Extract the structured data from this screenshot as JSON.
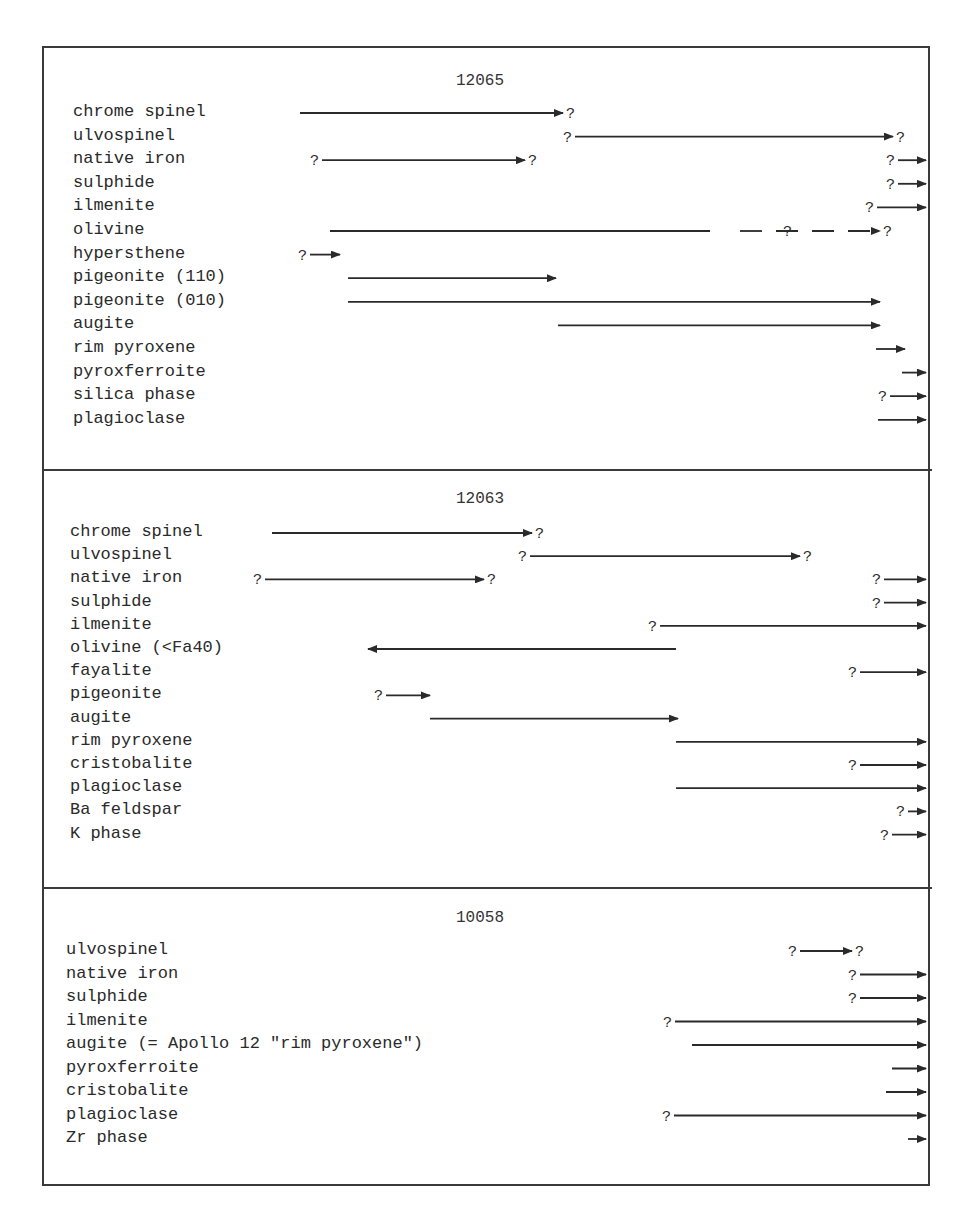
{
  "sections": [
    {
      "title": "12065",
      "title_x": 480,
      "title_y": 72,
      "label_x": 73,
      "row_start_y": 112,
      "row_step": 23.6,
      "rows": [
        {
          "label": "chrome spinel",
          "x1": 300,
          "x2": 563,
          "q_start": false,
          "q_end": true,
          "arrow": true
        },
        {
          "label": "ulvospinel",
          "x1": 575,
          "x2": 893,
          "q_start": true,
          "q_end": true,
          "arrow": true
        },
        {
          "label": "native iron",
          "x1": 322,
          "x2": 525,
          "q_start": true,
          "q_end": true,
          "arrow": true,
          "extra": {
            "x1": 898,
            "x2": 926,
            "q_start": true
          }
        },
        {
          "label": "sulphide",
          "x1": 898,
          "x2": 926,
          "q_start": true,
          "q_end": false,
          "arrow": true
        },
        {
          "label": "ilmenite",
          "x1": 877,
          "x2": 926,
          "q_start": true,
          "q_end": false,
          "arrow": true
        },
        {
          "label": "olivine",
          "x1": 330,
          "x2": 710,
          "q_start": false,
          "q_end": false,
          "arrow": false,
          "dashed_tail": {
            "x1": 740,
            "x2": 880,
            "q_mid_x": 783,
            "q_end": true
          }
        },
        {
          "label": "hypersthene",
          "x1": 310,
          "x2": 340,
          "q_start": true,
          "q_end": false,
          "arrow": true
        },
        {
          "label": "pigeonite (110)",
          "x1": 348,
          "x2": 556,
          "q_start": false,
          "q_end": false,
          "arrow": true
        },
        {
          "label": "pigeonite (010)",
          "x1": 348,
          "x2": 880,
          "q_start": false,
          "q_end": false,
          "arrow": true
        },
        {
          "label": "augite",
          "x1": 558,
          "x2": 880,
          "q_start": false,
          "q_end": false,
          "arrow": true
        },
        {
          "label": "rim pyroxene",
          "x1": 876,
          "x2": 905,
          "q_start": false,
          "q_end": false,
          "arrow": true
        },
        {
          "label": "pyroxferroite",
          "x1": 902,
          "x2": 926,
          "q_start": false,
          "q_end": false,
          "arrow": true
        },
        {
          "label": "silica phase",
          "x1": 890,
          "x2": 926,
          "q_start": true,
          "q_end": false,
          "arrow": true
        },
        {
          "label": "plagioclase",
          "x1": 878,
          "x2": 926,
          "q_start": false,
          "q_end": false,
          "arrow": true
        }
      ]
    },
    {
      "title": "12063",
      "title_x": 480,
      "title_y": 490,
      "label_x": 70,
      "row_start_y": 532,
      "row_step": 23.2,
      "rows": [
        {
          "label": "chrome spinel",
          "x1": 272,
          "x2": 532,
          "q_start": false,
          "q_end": true,
          "arrow": true
        },
        {
          "label": "ulvospinel",
          "x1": 530,
          "x2": 800,
          "q_start": true,
          "q_end": true,
          "arrow": true
        },
        {
          "label": "native iron",
          "x1": 265,
          "x2": 484,
          "q_start": true,
          "q_end": true,
          "arrow": true,
          "extra": {
            "x1": 884,
            "x2": 926,
            "q_start": true
          }
        },
        {
          "label": "sulphide",
          "x1": 884,
          "x2": 926,
          "q_start": true,
          "q_end": false,
          "arrow": true
        },
        {
          "label": "ilmenite",
          "x1": 660,
          "x2": 926,
          "q_start": true,
          "q_end": false,
          "arrow": true
        },
        {
          "label": "olivine (<Fa40)",
          "x1": 368,
          "x2": 676,
          "q_start": false,
          "q_end": false,
          "arrow": false,
          "arrow_left": true
        },
        {
          "label": "fayalite",
          "x1": 860,
          "x2": 926,
          "q_start": true,
          "q_end": false,
          "arrow": true
        },
        {
          "label": "pigeonite",
          "x1": 386,
          "x2": 430,
          "q_start": true,
          "q_end": false,
          "arrow": true
        },
        {
          "label": "augite",
          "x1": 430,
          "x2": 678,
          "q_start": false,
          "q_end": false,
          "arrow": true
        },
        {
          "label": "rim pyroxene",
          "x1": 676,
          "x2": 926,
          "q_start": false,
          "q_end": false,
          "arrow": true
        },
        {
          "label": "cristobalite",
          "x1": 860,
          "x2": 926,
          "q_start": true,
          "q_end": false,
          "arrow": true
        },
        {
          "label": "plagioclase",
          "x1": 676,
          "x2": 926,
          "q_start": false,
          "q_end": false,
          "arrow": true
        },
        {
          "label": "Ba feldspar",
          "x1": 908,
          "x2": 926,
          "q_start": true,
          "q_end": false,
          "arrow": true
        },
        {
          "label": "K phase",
          "x1": 892,
          "x2": 926,
          "q_start": true,
          "q_end": false,
          "arrow": true
        }
      ]
    },
    {
      "title": "10058",
      "title_x": 480,
      "title_y": 909,
      "label_x": 66,
      "row_start_y": 950,
      "row_step": 23.5,
      "rows": [
        {
          "label": "ulvospinel",
          "x1": 800,
          "x2": 852,
          "q_start": true,
          "q_end": true,
          "arrow": true
        },
        {
          "label": "native iron",
          "x1": 860,
          "x2": 926,
          "q_start": true,
          "q_end": false,
          "arrow": true
        },
        {
          "label": "sulphide",
          "x1": 860,
          "x2": 926,
          "q_start": true,
          "q_end": false,
          "arrow": true
        },
        {
          "label": "ilmenite",
          "x1": 675,
          "x2": 926,
          "q_start": true,
          "q_end": false,
          "arrow": true
        },
        {
          "label": "augite (= Apollo 12 \"rim pyroxene\")",
          "x1": 692,
          "x2": 926,
          "q_start": false,
          "q_end": false,
          "arrow": true
        },
        {
          "label": "pyroxferroite",
          "x1": 892,
          "x2": 926,
          "q_start": false,
          "q_end": false,
          "arrow": true
        },
        {
          "label": "cristobalite",
          "x1": 886,
          "x2": 926,
          "q_start": false,
          "q_end": false,
          "arrow": true
        },
        {
          "label": "plagioclase",
          "x1": 674,
          "x2": 926,
          "q_start": true,
          "q_end": false,
          "arrow": true
        },
        {
          "label": "Zr phase",
          "x1": 908,
          "x2": 926,
          "q_start": false,
          "q_end": false,
          "arrow": true
        }
      ]
    }
  ],
  "legend_symbols": {
    "uncertain": "?",
    "continues": "→"
  }
}
